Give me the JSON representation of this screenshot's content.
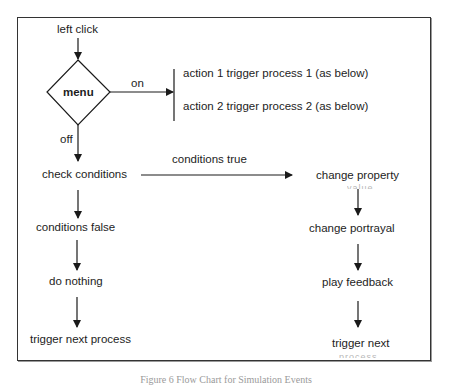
{
  "diagram": {
    "type": "flowchart",
    "nodes": {
      "start": "left click",
      "menu": "menu",
      "action1": "action 1 trigger process 1 (as below)",
      "action2": "action 2 trigger process 2 (as below)",
      "check": "check conditions",
      "cond_false": "conditions false",
      "do_nothing": "do nothing",
      "trigger_next_process": "trigger next process",
      "change_property": "change property",
      "change_property_cont": "value",
      "change_portrayal": "change portrayal",
      "play_feedback": "play feedback",
      "trigger_next": "trigger next",
      "trigger_next_cont": "process"
    },
    "edge_labels": {
      "on": "on",
      "off": "off",
      "conditions_true": "conditions true"
    },
    "edges": [
      {
        "from": "start",
        "to": "menu"
      },
      {
        "from": "menu",
        "to": "action1/action2",
        "label": "on"
      },
      {
        "from": "menu",
        "to": "check",
        "label": "off"
      },
      {
        "from": "check",
        "to": "change_property",
        "label": "conditions true"
      },
      {
        "from": "check",
        "to": "cond_false"
      },
      {
        "from": "cond_false",
        "to": "do_nothing"
      },
      {
        "from": "do_nothing",
        "to": "trigger_next_process"
      },
      {
        "from": "change_property",
        "to": "change_portrayal"
      },
      {
        "from": "change_portrayal",
        "to": "play_feedback"
      },
      {
        "from": "play_feedback",
        "to": "trigger_next"
      }
    ]
  },
  "caption": "Figure 6 Flow Chart for Simulation Events",
  "colors": {
    "stroke": "#1a1a1a",
    "frame": "#333333",
    "background": "#ffffff"
  }
}
